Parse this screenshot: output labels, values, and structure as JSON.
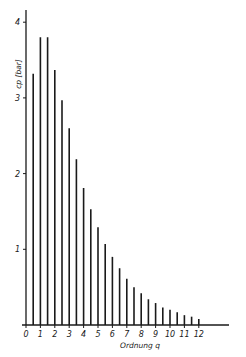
{
  "chart_data": {
    "type": "bar",
    "title": "",
    "xlabel": "Ordnung q",
    "ylabel": "cp [bar]",
    "x": [
      0.5,
      1.0,
      1.5,
      2.0,
      2.5,
      3.0,
      3.5,
      4.0,
      4.5,
      5.0,
      5.5,
      6.0,
      6.5,
      7.0,
      7.5,
      8.0,
      8.5,
      9.0,
      9.5,
      10.0,
      10.5,
      11.0,
      11.5,
      12.0
    ],
    "values": [
      3.32,
      3.8,
      3.8,
      3.37,
      2.97,
      2.6,
      2.19,
      1.81,
      1.53,
      1.29,
      1.07,
      0.9,
      0.75,
      0.61,
      0.5,
      0.42,
      0.34,
      0.29,
      0.23,
      0.2,
      0.17,
      0.13,
      0.11,
      0.08
    ],
    "xticks": [
      "0",
      "1",
      "2",
      "3",
      "4",
      "5",
      "6",
      "7",
      "8",
      "9",
      "10",
      "11",
      "12"
    ],
    "yticks": [
      "1",
      "2",
      "3",
      "4"
    ],
    "xlim": [
      0,
      14.2
    ],
    "ylim": [
      0,
      4.2
    ],
    "grid": false,
    "legend": null,
    "style": "stem / line spectrum"
  }
}
